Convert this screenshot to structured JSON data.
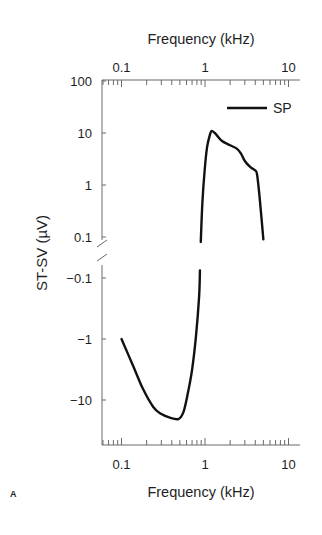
{
  "figure": {
    "panel_label": "A"
  },
  "chart_data": {
    "type": "line",
    "title": "",
    "xlabel": "Frequency (kHz)",
    "xlabel_top": "Frequency (kHz)",
    "ylabel": "ST-SV (µV)",
    "xscale": "log",
    "xlim": [
      0.06,
      13
    ],
    "xticks": [
      0.1,
      1,
      10
    ],
    "xtick_labels": [
      "0.1",
      "1",
      "10"
    ],
    "yscale": "log magnitude, broken axis (positive above, negative below)",
    "ylim_upper": [
      0.1,
      100
    ],
    "ylim_lower": [
      -55,
      -0.07
    ],
    "yticks": [
      100,
      10,
      1,
      0.1,
      -0.1,
      -1,
      -10
    ],
    "ytick_labels": [
      "100",
      "10",
      "1",
      "0.1",
      "−0.1",
      "−1",
      "−10"
    ],
    "grid": false,
    "legend": {
      "entries": [
        "SP"
      ],
      "position": "upper right"
    },
    "series": [
      {
        "name": "SP",
        "color": "#111111",
        "segments": [
          {
            "x": [
              0.1,
              0.14,
              0.18,
              0.24,
              0.3,
              0.38,
              0.48,
              0.55,
              0.62,
              0.7,
              0.78,
              0.85,
              0.87
            ],
            "y": [
              -1.0,
              -2.9,
              -6.5,
              -13,
              -17,
              -19.5,
              -20.5,
              -16,
              -8,
              -3.2,
              -0.9,
              -0.2,
              -0.075
            ]
          },
          {
            "x": [
              0.89,
              0.93,
              0.99,
              1.06,
              1.15,
              1.21,
              1.35,
              1.6,
              2.0,
              2.4,
              2.7,
              3.0,
              3.5,
              4.0,
              4.2,
              4.5,
              5.0
            ],
            "y": [
              0.08,
              0.45,
              1.9,
              5.4,
              9.5,
              11,
              9.5,
              7,
              5.8,
              5.0,
              4.0,
              2.9,
              2.2,
              1.9,
              1.6,
              0.6,
              0.09
            ]
          }
        ]
      }
    ]
  }
}
